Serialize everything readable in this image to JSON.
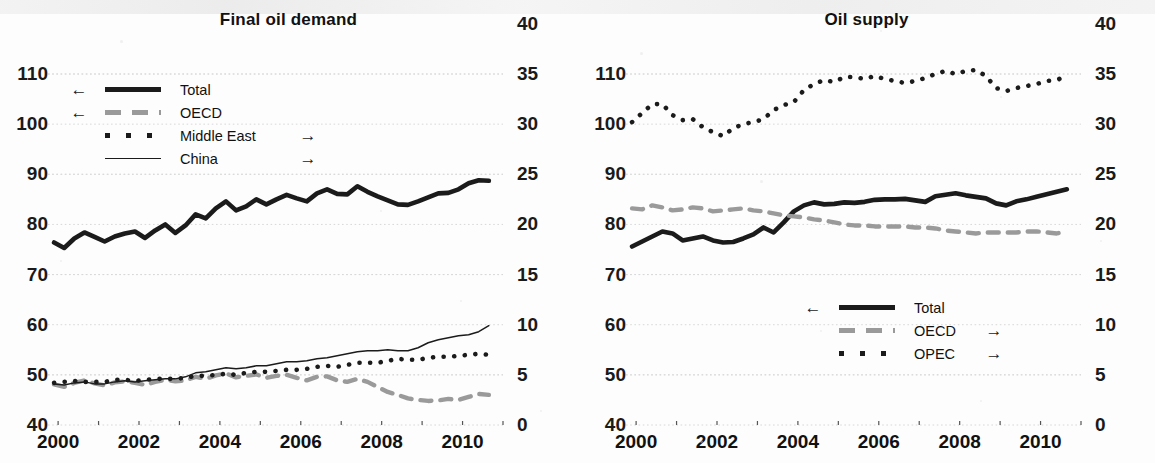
{
  "page": {
    "background_color": "#fdfdfd",
    "ink_color": "#1b1b1b",
    "gray_color": "#9a9a9a",
    "grid_color": "#d8d8d8"
  },
  "panels": [
    {
      "id": "final-oil-demand",
      "title": "Final oil demand",
      "legend": {
        "position": "top-left",
        "entries": [
          {
            "label": "Total",
            "arrow_left": "←",
            "arrow_right": "",
            "style": "solid-thick",
            "color": "#1b1b1b",
            "axis": "left"
          },
          {
            "label": "OECD",
            "arrow_left": "←",
            "arrow_right": "",
            "style": "dashed",
            "color": "#9a9a9a",
            "axis": "left"
          },
          {
            "label": "Middle East",
            "arrow_left": "",
            "arrow_right": "→",
            "style": "dotted",
            "color": "#1b1b1b",
            "axis": "right"
          },
          {
            "label": "China",
            "arrow_left": "",
            "arrow_right": "→",
            "style": "solid-thin",
            "color": "#1b1b1b",
            "axis": "right"
          }
        ]
      }
    },
    {
      "id": "oil-supply",
      "title": "Oil supply",
      "legend": {
        "position": "center-right",
        "entries": [
          {
            "label": "Total",
            "arrow_left": "←",
            "arrow_right": "",
            "style": "solid-thick",
            "color": "#1b1b1b",
            "axis": "left"
          },
          {
            "label": "OECD",
            "arrow_left": "",
            "arrow_right": "→",
            "style": "dashed",
            "color": "#9a9a9a",
            "axis": "right"
          },
          {
            "label": "OPEC",
            "arrow_left": "",
            "arrow_right": "→",
            "style": "dotted",
            "color": "#1b1b1b",
            "axis": "right"
          }
        ]
      }
    }
  ],
  "chart_data": [
    {
      "type": "line",
      "title": "Final oil demand",
      "xlabel": "",
      "ylabel": "",
      "grid": true,
      "legend_position": "top-left",
      "x_ticks": [
        2000,
        2001,
        2002,
        2003,
        2004,
        2005,
        2006,
        2007,
        2008,
        2009,
        2010,
        2011
      ],
      "x_tick_labels": [
        "2000",
        "",
        "2002",
        "",
        "2004",
        "",
        "2006",
        "",
        "2008",
        "",
        "2010",
        ""
      ],
      "xlim": [
        1999.75,
        2011.0
      ],
      "y_left_label_list": [
        "110",
        "100",
        "90",
        "80",
        "70",
        "60",
        "50",
        "40"
      ],
      "y_right_label_list": [
        "40",
        "35",
        "30",
        "25",
        "20",
        "15",
        "10",
        "5",
        "0"
      ],
      "ylim_left": [
        40,
        110
      ],
      "ylim_right": [
        0,
        40
      ],
      "axis_mapping": "right = (left - 40) / 2",
      "series": [
        {
          "name": "Total",
          "axis": "left",
          "style": "solid-thick",
          "color": "#1b1b1b",
          "x": [
            1999.9,
            2000.15,
            2000.4,
            2000.65,
            2000.9,
            2001.15,
            2001.4,
            2001.65,
            2001.9,
            2002.15,
            2002.4,
            2002.65,
            2002.9,
            2003.15,
            2003.4,
            2003.65,
            2003.9,
            2004.15,
            2004.4,
            2004.65,
            2004.9,
            2005.15,
            2005.4,
            2005.65,
            2005.9,
            2006.15,
            2006.4,
            2006.65,
            2006.9,
            2007.15,
            2007.4,
            2007.65,
            2007.9,
            2008.15,
            2008.4,
            2008.65,
            2008.9,
            2009.15,
            2009.4,
            2009.65,
            2009.9,
            2010.15,
            2010.4,
            2010.65
          ],
          "y": [
            76.4,
            75.3,
            77.2,
            78.4,
            77.5,
            76.6,
            77.6,
            78.2,
            78.6,
            77.3,
            78.8,
            80.0,
            78.3,
            79.8,
            82.0,
            81.2,
            83.2,
            84.6,
            82.8,
            83.6,
            85.0,
            84.0,
            85.0,
            85.9,
            85.2,
            84.6,
            86.2,
            87.0,
            86.1,
            86.0,
            87.6,
            86.5,
            85.6,
            84.8,
            84.0,
            83.9,
            84.6,
            85.4,
            86.2,
            86.3,
            87.0,
            88.2,
            88.8,
            88.7
          ]
        },
        {
          "name": "OECD",
          "axis": "left",
          "style": "dashed",
          "color": "#9a9a9a",
          "x": [
            1999.9,
            2000.15,
            2000.4,
            2000.65,
            2000.9,
            2001.15,
            2001.4,
            2001.65,
            2001.9,
            2002.15,
            2002.4,
            2002.65,
            2002.9,
            2003.15,
            2003.4,
            2003.65,
            2003.9,
            2004.15,
            2004.4,
            2004.65,
            2004.9,
            2005.15,
            2005.4,
            2005.65,
            2005.9,
            2006.15,
            2006.4,
            2006.65,
            2006.9,
            2007.15,
            2007.4,
            2007.65,
            2007.9,
            2008.15,
            2008.4,
            2008.65,
            2008.9,
            2009.15,
            2009.4,
            2009.65,
            2009.9,
            2010.15,
            2010.4,
            2010.65
          ],
          "y": [
            48.1,
            47.6,
            48.4,
            48.9,
            48.3,
            47.9,
            48.5,
            48.7,
            48.4,
            48.0,
            48.6,
            49.0,
            48.7,
            48.9,
            49.6,
            49.2,
            49.9,
            50.3,
            49.5,
            49.8,
            50.1,
            49.4,
            49.8,
            50.0,
            49.4,
            48.9,
            49.6,
            49.7,
            48.9,
            48.6,
            49.2,
            48.6,
            47.6,
            46.6,
            46.0,
            45.3,
            45.0,
            44.8,
            44.9,
            45.2,
            45.0,
            45.6,
            46.2,
            46.0
          ]
        },
        {
          "name": "Middle East",
          "axis": "right",
          "style": "dotted",
          "color": "#1b1b1b",
          "x": [
            1999.9,
            2000.15,
            2000.4,
            2000.65,
            2000.9,
            2001.15,
            2001.4,
            2001.65,
            2001.9,
            2002.15,
            2002.4,
            2002.65,
            2002.9,
            2003.15,
            2003.4,
            2003.65,
            2003.9,
            2004.15,
            2004.4,
            2004.65,
            2004.9,
            2005.15,
            2005.4,
            2005.65,
            2005.9,
            2006.15,
            2006.4,
            2006.65,
            2006.9,
            2007.15,
            2007.4,
            2007.65,
            2007.9,
            2008.15,
            2008.4,
            2008.65,
            2008.9,
            2009.15,
            2009.4,
            2009.65,
            2009.9,
            2010.15,
            2010.4,
            2010.65
          ],
          "y": [
            4.2,
            4.3,
            4.4,
            4.3,
            4.3,
            4.3,
            4.5,
            4.5,
            4.4,
            4.5,
            4.6,
            4.6,
            4.6,
            4.7,
            4.9,
            4.9,
            5.0,
            5.1,
            5.0,
            5.2,
            5.3,
            5.3,
            5.4,
            5.5,
            5.5,
            5.6,
            5.8,
            5.9,
            5.8,
            6.0,
            6.2,
            6.2,
            6.2,
            6.4,
            6.6,
            6.5,
            6.5,
            6.7,
            6.8,
            6.8,
            6.9,
            7.0,
            7.1,
            7.0
          ]
        },
        {
          "name": "China",
          "axis": "right",
          "style": "solid-thin",
          "color": "#1b1b1b",
          "x": [
            1999.9,
            2000.15,
            2000.4,
            2000.65,
            2000.9,
            2001.15,
            2001.4,
            2001.65,
            2001.9,
            2002.15,
            2002.4,
            2002.65,
            2002.9,
            2003.15,
            2003.4,
            2003.65,
            2003.9,
            2004.15,
            2004.4,
            2004.65,
            2004.9,
            2005.15,
            2005.4,
            2005.65,
            2005.9,
            2006.15,
            2006.4,
            2006.65,
            2006.9,
            2007.15,
            2007.4,
            2007.65,
            2007.9,
            2008.15,
            2008.4,
            2008.65,
            2008.9,
            2009.15,
            2009.4,
            2009.65,
            2009.9,
            2010.15,
            2010.4,
            2010.65
          ],
          "y": [
            4.1,
            4.0,
            4.2,
            4.3,
            4.1,
            4.1,
            4.3,
            4.4,
            4.3,
            4.4,
            4.5,
            4.6,
            4.6,
            4.8,
            5.2,
            5.3,
            5.5,
            5.7,
            5.6,
            5.7,
            5.9,
            5.9,
            6.1,
            6.3,
            6.3,
            6.4,
            6.6,
            6.7,
            6.9,
            7.1,
            7.3,
            7.4,
            7.4,
            7.5,
            7.4,
            7.4,
            7.7,
            8.2,
            8.5,
            8.7,
            8.9,
            9.0,
            9.3,
            9.9
          ]
        }
      ]
    },
    {
      "type": "line",
      "title": "Oil supply",
      "xlabel": "",
      "ylabel": "",
      "grid": true,
      "legend_position": "center-right",
      "x_ticks": [
        2000,
        2001,
        2002,
        2003,
        2004,
        2005,
        2006,
        2007,
        2008,
        2009,
        2010,
        2011
      ],
      "x_tick_labels": [
        "2000",
        "",
        "2002",
        "",
        "2004",
        "",
        "2006",
        "",
        "2008",
        "",
        "2010",
        ""
      ],
      "xlim": [
        1999.75,
        2011.0
      ],
      "y_left_label_list": [
        "110",
        "100",
        "90",
        "80",
        "70",
        "60",
        "50",
        "40"
      ],
      "y_right_label_list": [
        "40",
        "35",
        "30",
        "25",
        "20",
        "15",
        "10",
        "5",
        "0"
      ],
      "ylim_left": [
        40,
        110
      ],
      "ylim_right": [
        0,
        40
      ],
      "axis_mapping": "right = (left - 40) / 2",
      "series": [
        {
          "name": "Total",
          "axis": "left",
          "style": "solid-thick",
          "color": "#1b1b1b",
          "x": [
            1999.9,
            2000.15,
            2000.4,
            2000.65,
            2000.9,
            2001.15,
            2001.4,
            2001.65,
            2001.9,
            2002.15,
            2002.4,
            2002.65,
            2002.9,
            2003.15,
            2003.4,
            2003.65,
            2003.9,
            2004.15,
            2004.4,
            2004.65,
            2004.9,
            2005.15,
            2005.4,
            2005.65,
            2005.9,
            2006.15,
            2006.4,
            2006.65,
            2006.9,
            2007.15,
            2007.4,
            2007.65,
            2007.9,
            2008.15,
            2008.4,
            2008.65,
            2008.9,
            2009.15,
            2009.4,
            2009.65,
            2009.9,
            2010.15,
            2010.4,
            2010.65
          ],
          "y": [
            75.6,
            76.6,
            77.6,
            78.6,
            78.2,
            76.8,
            77.2,
            77.6,
            76.8,
            76.4,
            76.5,
            77.2,
            78.0,
            79.4,
            78.4,
            80.4,
            82.6,
            83.8,
            84.4,
            84.0,
            84.1,
            84.4,
            84.3,
            84.5,
            84.9,
            85.0,
            85.0,
            85.1,
            84.8,
            84.5,
            85.6,
            85.9,
            86.2,
            85.8,
            85.5,
            85.2,
            84.2,
            83.8,
            84.6,
            85.0,
            85.5,
            86.0,
            86.5,
            87.0
          ]
        },
        {
          "name": "OECD",
          "axis": "right",
          "style": "dashed",
          "color": "#9a9a9a",
          "x": [
            1999.9,
            2000.15,
            2000.4,
            2000.65,
            2000.9,
            2001.15,
            2001.4,
            2001.65,
            2001.9,
            2002.15,
            2002.4,
            2002.65,
            2002.9,
            2003.15,
            2003.4,
            2003.65,
            2003.9,
            2004.15,
            2004.4,
            2004.65,
            2004.9,
            2005.15,
            2005.4,
            2005.65,
            2005.9,
            2006.15,
            2006.4,
            2006.65,
            2006.9,
            2007.15,
            2007.4,
            2007.65,
            2007.9,
            2008.15,
            2008.4,
            2008.65,
            2008.9,
            2009.15,
            2009.4,
            2009.65,
            2009.9,
            2010.15,
            2010.4,
            2010.65
          ],
          "y": [
            21.6,
            21.5,
            21.9,
            21.7,
            21.4,
            21.5,
            21.7,
            21.6,
            21.3,
            21.4,
            21.5,
            21.6,
            21.4,
            21.3,
            21.1,
            20.9,
            20.8,
            20.7,
            20.5,
            20.4,
            20.2,
            20.0,
            19.9,
            19.9,
            19.8,
            19.8,
            19.8,
            19.8,
            19.7,
            19.7,
            19.6,
            19.4,
            19.3,
            19.2,
            19.1,
            19.2,
            19.2,
            19.2,
            19.2,
            19.3,
            19.3,
            19.2,
            19.1,
            19.3
          ]
        },
        {
          "name": "OPEC",
          "axis": "right",
          "style": "dotted",
          "color": "#1b1b1b",
          "x": [
            1999.9,
            2000.15,
            2000.4,
            2000.65,
            2000.9,
            2001.15,
            2001.4,
            2001.65,
            2001.9,
            2002.15,
            2002.4,
            2002.65,
            2002.9,
            2003.15,
            2003.4,
            2003.65,
            2003.9,
            2004.15,
            2004.4,
            2004.65,
            2004.9,
            2005.15,
            2005.4,
            2005.65,
            2005.9,
            2006.15,
            2006.4,
            2006.65,
            2006.9,
            2007.15,
            2007.4,
            2007.65,
            2007.9,
            2008.15,
            2008.4,
            2008.65,
            2008.9,
            2009.15,
            2009.4,
            2009.65,
            2009.9,
            2010.15,
            2010.4,
            2010.65
          ],
          "y": [
            30.2,
            31.1,
            32.0,
            32.0,
            30.9,
            30.4,
            30.5,
            29.7,
            29.2,
            28.8,
            29.6,
            30.0,
            30.2,
            30.5,
            31.4,
            31.9,
            32.2,
            33.4,
            34.0,
            34.4,
            34.2,
            34.7,
            34.7,
            34.5,
            34.8,
            34.5,
            34.3,
            34.1,
            34.3,
            34.6,
            35.0,
            35.3,
            35.0,
            35.3,
            35.4,
            34.8,
            33.6,
            33.3,
            33.6,
            33.8,
            34.0,
            34.3,
            34.4,
            34.8
          ]
        }
      ]
    }
  ]
}
